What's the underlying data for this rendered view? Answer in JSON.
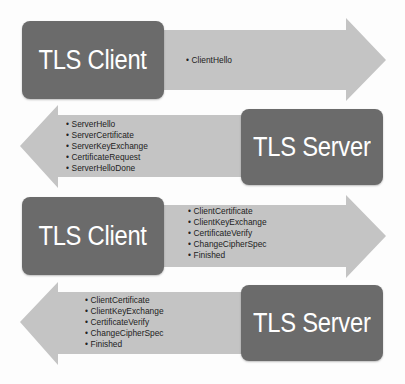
{
  "diagram": {
    "colors": {
      "box": "#6b6b6b",
      "arrow": "#c4c4c4",
      "box_text": "#ffffff",
      "list_text": "#222222"
    },
    "steps": [
      {
        "direction": "right",
        "actor": "TLS Client",
        "messages": [
          "ClientHello"
        ]
      },
      {
        "direction": "left",
        "actor": "TLS Server",
        "messages": [
          "ServerHello",
          "ServerCertificate",
          "ServerKeyExchange",
          "CertificateRequest",
          "ServerHelloDone"
        ]
      },
      {
        "direction": "right",
        "actor": "TLS Client",
        "messages": [
          "ClientCertificate",
          "ClientKeyExchange",
          "CertificateVerify",
          "ChangeCipherSpec",
          "Finished"
        ]
      },
      {
        "direction": "left",
        "actor": "TLS Server",
        "messages": [
          "ClientCertificate",
          "ClientKeyExchange",
          "CertificateVerify",
          "ChangeCipherSpec",
          "Finished"
        ]
      }
    ]
  }
}
